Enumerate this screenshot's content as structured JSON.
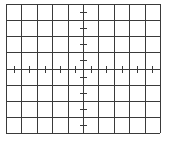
{
  "graticule": {
    "left": 6,
    "top": 4,
    "right": 160,
    "bottom": 133,
    "columns": 10,
    "rows": 8,
    "grid_color": "#3a3a3a",
    "tick_color": "#3a3a3a",
    "background": "#ffffff",
    "ticks_per_division": 2,
    "tick_length": 7,
    "line_width": 1
  }
}
